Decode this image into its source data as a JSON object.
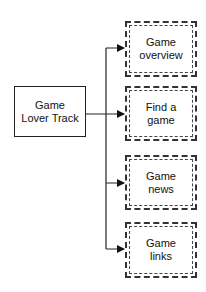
{
  "diagram": {
    "root": {
      "label": "Game\nLover Track"
    },
    "children": [
      {
        "label": "Game\noverview"
      },
      {
        "label": "Find a\ngame"
      },
      {
        "label": "Game\nnews"
      },
      {
        "label": "Game\nlinks"
      }
    ]
  }
}
